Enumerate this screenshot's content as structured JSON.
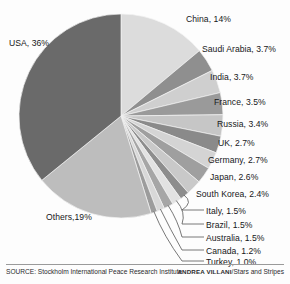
{
  "chart_data": {
    "type": "pie",
    "title": "",
    "unit": "percent",
    "start_angle_deg": 0,
    "direction": "clockwise",
    "categories": [
      "China",
      "Saudi Arabia",
      "India",
      "France",
      "Russia",
      "UK",
      "Germany",
      "Japan",
      "South Korea",
      "Italy",
      "Brazil",
      "Australia",
      "Canada",
      "Turkey",
      "Others",
      "USA"
    ],
    "values": [
      14,
      3.7,
      3.7,
      3.5,
      3.4,
      2.7,
      2.7,
      2.6,
      2.4,
      1.5,
      1.5,
      1.5,
      1.2,
      1.0,
      19,
      36
    ],
    "slices": [
      {
        "label": "China, 14%",
        "name": "China",
        "value": 14,
        "color": "#dcdcdc",
        "leader": false
      },
      {
        "label": "Saudi Arabia, 3.7%",
        "name": "Saudi Arabia",
        "value": 3.7,
        "color": "#8f8f8f",
        "leader": false
      },
      {
        "label": "India, 3.7%",
        "name": "India",
        "value": 3.7,
        "color": "#cfcfcf",
        "leader": false
      },
      {
        "label": "France, 3.5%",
        "name": "France",
        "value": 3.5,
        "color": "#9a9a9a",
        "leader": false
      },
      {
        "label": "Russia, 3.4%",
        "name": "Russia",
        "value": 3.4,
        "color": "#c6c6c6",
        "leader": false
      },
      {
        "label": "UK, 2.7%",
        "name": "UK",
        "value": 2.7,
        "color": "#8a8a8a",
        "leader": false
      },
      {
        "label": "Germany, 2.7%",
        "name": "Germany",
        "value": 2.7,
        "color": "#d4d4d4",
        "leader": false
      },
      {
        "label": "Japan, 2.6%",
        "name": "Japan",
        "value": 2.6,
        "color": "#9f9f9f",
        "leader": false
      },
      {
        "label": "South Korea, 2.4%",
        "name": "South Korea",
        "value": 2.4,
        "color": "#c9c9c9",
        "leader": false
      },
      {
        "label": "Italy, 1.5%",
        "name": "Italy",
        "value": 1.5,
        "color": "#8d8d8d",
        "leader": true
      },
      {
        "label": "Brazil, 1.5%",
        "name": "Brazil",
        "value": 1.5,
        "color": "#e2e2e2",
        "leader": true
      },
      {
        "label": "Australia, 1.5%",
        "name": "Australia",
        "value": 1.5,
        "color": "#a6a6a6",
        "leader": true
      },
      {
        "label": "Canada, 1.2%",
        "name": "Canada",
        "value": 1.2,
        "color": "#d8d8d8",
        "leader": true
      },
      {
        "label": "Turkey, 1.0%",
        "name": "Turkey",
        "value": 1.0,
        "color": "#9c9c9c",
        "leader": true
      },
      {
        "label": "Others,19%",
        "name": "Others",
        "value": 19,
        "color": "#bdbdbd",
        "leader": false
      },
      {
        "label": "USA, 36%",
        "name": "USA",
        "value": 36,
        "color": "#6a6a6a",
        "leader": false
      }
    ],
    "legend_position": "callout-labels",
    "grid": false
  },
  "labels": {
    "china": "China, 14%",
    "saudi_arabia": "Saudi Arabia, 3.7%",
    "india": "India, 3.7%",
    "france": "France, 3.5%",
    "russia": "Russia, 3.4%",
    "uk": "UK, 2.7%",
    "germany": "Germany, 2.7%",
    "japan": "Japan, 2.6%",
    "south_korea": "South Korea, 2.4%",
    "italy": "Italy, 1.5%",
    "brazil": "Brazil, 1.5%",
    "australia": "Australia, 1.5%",
    "canada": "Canada, 1.2%",
    "turkey": "Turkey, 1.0%",
    "others": "Others,19%",
    "usa": "USA, 36%"
  },
  "footer": {
    "source": "SOURCE: Stockholm International Peace Research Institute",
    "credit_author": "ANDREA VILLANI",
    "credit_publication": "/Stars and Stripes"
  }
}
